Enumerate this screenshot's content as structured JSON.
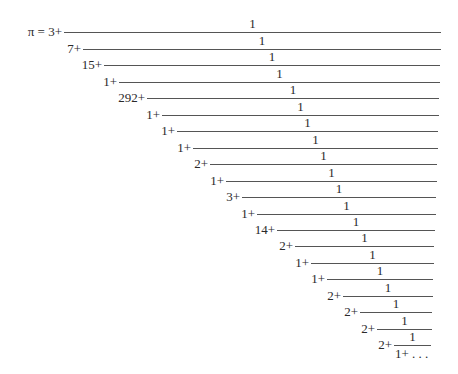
{
  "equation": {
    "lhs": "π =",
    "integer_part": "3",
    "numerator": "1",
    "plus": "+",
    "partial_denominators": [
      "7",
      "15",
      "1",
      "292",
      "1",
      "1",
      "1",
      "2",
      "1",
      "3",
      "1",
      "14",
      "2",
      "1",
      "1",
      "2",
      "2",
      "2",
      "2",
      "1"
    ],
    "ellipsis": "…",
    "description": "Generalized continued fraction expansion of pi"
  },
  "rows": [
    {
      "label": "π =  3+",
      "line_y": 32,
      "x0": 64,
      "x1": 441
    },
    {
      "label": "7+",
      "line_y": 49,
      "x0": 83,
      "x1": 441
    },
    {
      "label": "15+",
      "line_y": 65,
      "x0": 104,
      "x1": 440
    },
    {
      "label": "1+",
      "line_y": 82,
      "x0": 119,
      "x1": 440
    },
    {
      "label": "292+",
      "line_y": 98,
      "x0": 147,
      "x1": 439
    },
    {
      "label": "1+",
      "line_y": 115,
      "x0": 162,
      "x1": 439
    },
    {
      "label": "1+",
      "line_y": 131,
      "x0": 177,
      "x1": 438
    },
    {
      "label": "1+",
      "line_y": 148,
      "x0": 193,
      "x1": 438
    },
    {
      "label": "2+",
      "line_y": 164,
      "x0": 210,
      "x1": 437
    },
    {
      "label": "1+",
      "line_y": 181,
      "x0": 226,
      "x1": 437
    },
    {
      "label": "3+",
      "line_y": 197,
      "x0": 242,
      "x1": 436
    },
    {
      "label": "1+",
      "line_y": 214,
      "x0": 257,
      "x1": 436
    },
    {
      "label": "14+",
      "line_y": 230,
      "x0": 277,
      "x1": 435
    },
    {
      "label": "2+",
      "line_y": 246,
      "x0": 295,
      "x1": 434
    },
    {
      "label": "1+",
      "line_y": 263,
      "x0": 311,
      "x1": 434
    },
    {
      "label": "1+",
      "line_y": 279,
      "x0": 327,
      "x1": 433
    },
    {
      "label": "2+",
      "line_y": 296,
      "x0": 343,
      "x1": 433
    },
    {
      "label": "2+",
      "line_y": 312,
      "x0": 360,
      "x1": 432
    },
    {
      "label": "2+",
      "line_y": 329,
      "x0": 377,
      "x1": 432
    },
    {
      "label": "2+",
      "line_y": 345,
      "x0": 394,
      "x1": 431
    }
  ],
  "final_denominator": "1+ . . ."
}
